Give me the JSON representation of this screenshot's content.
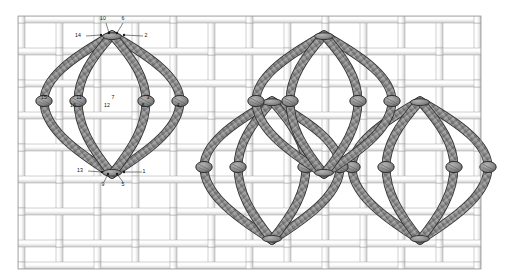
{
  "diagram": {
    "canvas_width": 508,
    "canvas_height": 280
  },
  "colors": {
    "background": "#ffffff",
    "canvas_thread_light": "#fbfbfb",
    "canvas_thread_shade": "#d8d8d8",
    "canvas_outline": "#9a9a9a",
    "floss_fill": "#8d8d8d",
    "floss_shade": "#6e6e6e",
    "floss_outline": "#2f2f2f",
    "knot_fill": "#8a8a8a",
    "label_text": "#111111",
    "leader_line": "#1a1a1a"
  },
  "ground": {
    "name": "woven-canvas-ground",
    "description": "plain-weave canvas of interlacing warp and weft bands",
    "vertical_bands": [
      {
        "x": 18,
        "w": 7
      },
      {
        "x": 56,
        "w": 7
      },
      {
        "x": 94,
        "w": 7
      },
      {
        "x": 132,
        "w": 7
      },
      {
        "x": 170,
        "w": 7
      },
      {
        "x": 208,
        "w": 7
      },
      {
        "x": 246,
        "w": 7
      },
      {
        "x": 284,
        "w": 7
      },
      {
        "x": 322,
        "w": 7
      },
      {
        "x": 360,
        "w": 7
      },
      {
        "x": 398,
        "w": 7
      },
      {
        "x": 436,
        "w": 7
      },
      {
        "x": 474,
        "w": 7
      }
    ],
    "horizontal_bands": [
      {
        "y": 16,
        "h": 7
      },
      {
        "y": 48,
        "h": 7
      },
      {
        "y": 80,
        "h": 7
      },
      {
        "y": 112,
        "h": 7
      },
      {
        "y": 144,
        "h": 7
      },
      {
        "y": 176,
        "h": 7
      },
      {
        "y": 208,
        "h": 7
      },
      {
        "y": 240,
        "h": 7
      },
      {
        "y": 262,
        "h": 7
      }
    ]
  },
  "motifs": [
    {
      "name": "motif-primary-labelled",
      "cx": 112,
      "top_y": 35,
      "bottom_y": 174,
      "mid_y": 101,
      "half_width": 68,
      "knot_count": 4,
      "labelled": true
    },
    {
      "name": "motif-upper-right",
      "cx": 324,
      "top_y": 35,
      "bottom_y": 174,
      "mid_y": 101,
      "half_width": 68,
      "knot_count": 4,
      "labelled": false
    },
    {
      "name": "motif-lower-left",
      "cx": 272,
      "top_y": 101,
      "bottom_y": 240,
      "mid_y": 167,
      "half_width": 68,
      "knot_count": 4,
      "labelled": false
    },
    {
      "name": "motif-lower-right",
      "cx": 420,
      "top_y": 101,
      "bottom_y": 240,
      "mid_y": 167,
      "half_width": 68,
      "knot_count": 4,
      "labelled": false
    }
  ],
  "labels": {
    "top_row": [
      {
        "id": "label-14",
        "text": "14",
        "tx": 78,
        "ty": 37,
        "lx1": 86,
        "ly1": 36,
        "lx2": 101,
        "ly2": 35
      },
      {
        "id": "label-10",
        "text": "10",
        "tx": 103,
        "ty": 20,
        "lx1": 106,
        "ly1": 23,
        "lx2": 109,
        "ly2": 33
      },
      {
        "id": "label-6",
        "text": "6",
        "tx": 123,
        "ty": 20,
        "lx1": 123,
        "ly1": 23,
        "lx2": 117,
        "ly2": 33
      },
      {
        "id": "label-2",
        "text": "2",
        "tx": 146,
        "ty": 37,
        "lx1": 143,
        "ly1": 36,
        "lx2": 124,
        "ly2": 35
      }
    ],
    "mid_row": [
      {
        "id": "label-15",
        "text": "15",
        "tx": 44,
        "ty": 99
      },
      {
        "id": "label-16",
        "text": "16",
        "tx": 73,
        "ty": 107
      },
      {
        "id": "label-11",
        "text": "11",
        "tx": 79,
        "ty": 99
      },
      {
        "id": "label-12",
        "text": "12",
        "tx": 107,
        "ty": 107
      },
      {
        "id": "label-7",
        "text": "7",
        "tx": 113,
        "ty": 99
      },
      {
        "id": "label-8",
        "text": "8",
        "tx": 143,
        "ty": 107
      },
      {
        "id": "label-3",
        "text": "3",
        "tx": 148,
        "ty": 99
      },
      {
        "id": "label-4",
        "text": "4",
        "tx": 178,
        "ty": 107
      }
    ],
    "bottom_row": [
      {
        "id": "label-13",
        "text": "13",
        "tx": 80,
        "ty": 172,
        "lx1": 88,
        "ly1": 171,
        "lx2": 102,
        "ly2": 172
      },
      {
        "id": "label-9",
        "text": "9",
        "tx": 103,
        "ty": 186,
        "lx1": 104,
        "ly1": 182,
        "lx2": 108,
        "ly2": 174
      },
      {
        "id": "label-5",
        "text": "5",
        "tx": 123,
        "ty": 186,
        "lx1": 123,
        "ly1": 182,
        "lx2": 117,
        "ly2": 174
      },
      {
        "id": "label-1",
        "text": "1",
        "tx": 144,
        "ty": 173,
        "lx1": 142,
        "ly1": 172,
        "lx2": 124,
        "ly2": 172
      }
    ]
  },
  "sequence_note": {
    "odd_numbers": "1, 5, 9, 13 — lower entry points",
    "even_numbers": "2, 6, 10, 14 — upper entry points",
    "knot_numbers": "3, 4, 7, 8, 11, 12, 15, 16 — mid-line crossing points"
  }
}
